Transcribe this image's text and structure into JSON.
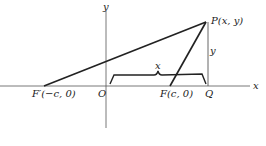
{
  "figure": {
    "type": "ellipse-foci-geometry",
    "axes": {
      "x_label": "x",
      "y_label": "y",
      "origin_label": "O"
    },
    "points": {
      "P": {
        "label": "P(x, y)"
      },
      "F": {
        "label": "F(c, 0)"
      },
      "F_prime": {
        "label": "F′(−c, 0)"
      },
      "Q": {
        "label": "Q"
      }
    },
    "segment_labels": {
      "brace_x": "x",
      "vertical_y": "y"
    },
    "colors": {
      "ink": "#222222",
      "axis": "#555555",
      "background": "#ffffff"
    }
  }
}
